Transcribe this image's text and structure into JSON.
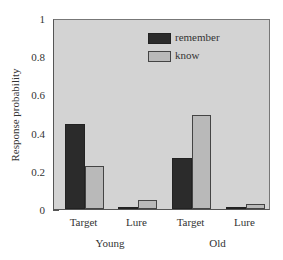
{
  "chart_data": {
    "type": "bar",
    "title": "",
    "xlabel": "",
    "ylabel": "Response probability",
    "ylim": [
      0,
      1
    ],
    "yticks": [
      0,
      0.2,
      0.4,
      0.6,
      0.8,
      1
    ],
    "ytick_labels": [
      "0",
      "0.2",
      "0.4",
      "0.6",
      "0.8",
      "1"
    ],
    "grid": false,
    "legend_position": "upper center",
    "groups": [
      "Young",
      "Old"
    ],
    "categories": [
      "Target",
      "Lure",
      "Target",
      "Lure"
    ],
    "category_groups": [
      "Young",
      "Young",
      "Old",
      "Old"
    ],
    "series": [
      {
        "name": "remember",
        "color": "#2b2b2b",
        "values": [
          0.45,
          0.01,
          0.27,
          0.01
        ]
      },
      {
        "name": "know",
        "color": "#b9b9b9",
        "values": [
          0.23,
          0.05,
          0.5,
          0.025
        ]
      }
    ]
  },
  "legend": {
    "items": [
      "remember",
      "know"
    ]
  },
  "axis": {
    "ylabel": "Response probability"
  },
  "colors": {
    "plot_background": "#d3d3d3",
    "remember": "#2b2b2b",
    "know": "#b9b9b9"
  }
}
